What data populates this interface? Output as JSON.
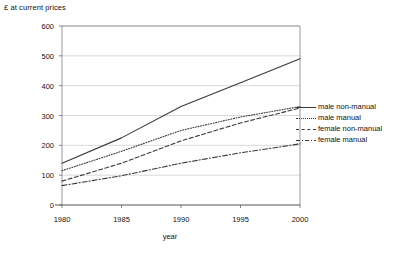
{
  "chart_data": {
    "type": "line",
    "title": "",
    "ylabel": "£ at current prices",
    "xlabel": "year",
    "x": [
      1980,
      1985,
      1990,
      1995,
      2000
    ],
    "xlim": [
      1980,
      2000
    ],
    "ylim": [
      0,
      600
    ],
    "ytick_labels": [
      "0",
      "100",
      "200",
      "300",
      "400",
      "500",
      "600"
    ],
    "ytick_values": [
      0,
      100,
      200,
      300,
      400,
      500,
      600
    ],
    "xtick_labels": [
      "1980",
      "1985",
      "1990",
      "1995",
      "2000"
    ],
    "grid": true,
    "legend_position": "right",
    "series": [
      {
        "name": "male non-manual",
        "style": "solid",
        "color": "#3a3a3a",
        "values": [
          140,
          225,
          330,
          410,
          490
        ]
      },
      {
        "name": "male manual",
        "style": "dotted",
        "color": "#3a3a3a",
        "values": [
          115,
          180,
          250,
          295,
          330
        ]
      },
      {
        "name": "female non-manual",
        "style": "dashed",
        "color": "#3a3a3a",
        "values": [
          80,
          140,
          215,
          275,
          325
        ]
      },
      {
        "name": "female manual",
        "style": "dashdot",
        "color": "#3a3a3a",
        "values": [
          65,
          98,
          140,
          175,
          205
        ]
      }
    ]
  },
  "axes": {
    "y_title": "£ at current prices",
    "x_title": "year"
  },
  "legend": {
    "items": [
      {
        "label": "male non-manual",
        "style": "solid"
      },
      {
        "label": "male manual",
        "style": "dotted"
      },
      {
        "label": "female non-manual",
        "style": "dashed"
      },
      {
        "label": "female manual",
        "style": "dashdot"
      }
    ]
  },
  "colors": {
    "line": "#3a3a3a",
    "grid": "#cfcfcf",
    "axis": "#9a9a9a",
    "text": "#111111",
    "background": "#ffffff"
  }
}
